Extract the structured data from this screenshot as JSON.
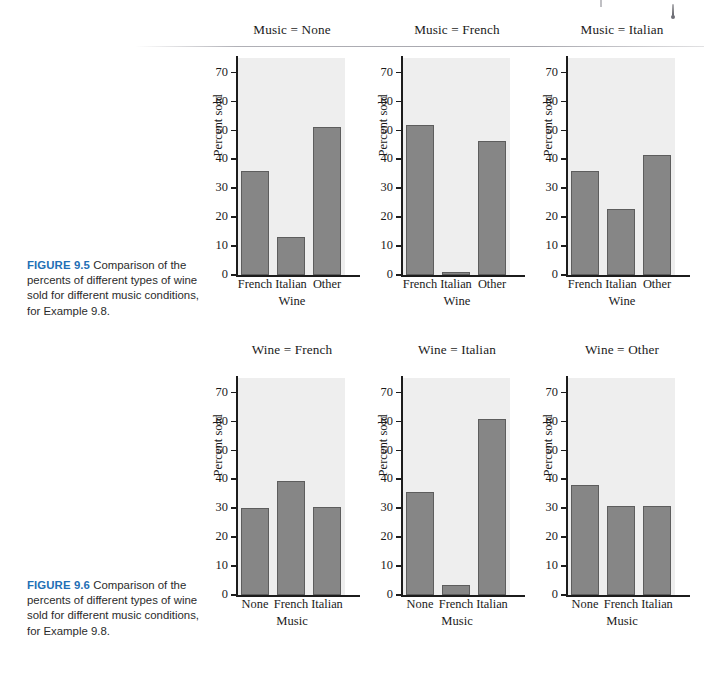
{
  "document": {
    "figures": [
      {
        "id": "figure-9-5",
        "caption_label": "FIGURE 9.5",
        "caption_text": "Comparison of the percents of different types of wine sold for different music conditions, for Example 9.8."
      },
      {
        "id": "figure-9-6",
        "caption_label": "FIGURE 9.6",
        "caption_text": "Comparison of the percents of different types of wine sold for different music conditions, for Example 9.8."
      }
    ]
  },
  "axis": {
    "y_label": "Percent sold",
    "y_ticks": [
      "0",
      "10",
      "20",
      "30",
      "40",
      "50",
      "60",
      "70"
    ],
    "y_tick_values": [
      0,
      10,
      20,
      30,
      40,
      50,
      60,
      70
    ],
    "y_min": 0,
    "y_max": 75
  },
  "colors": {
    "bar_fill": "#868686",
    "bar_stroke": "#5d5d5d",
    "plot_background": "#eeeeee",
    "axis": "#1c1c1c",
    "caption_label": "#1f6fb5",
    "page_background": "#ffffff"
  },
  "chart_data": [
    {
      "type": "bar",
      "title": "Music = None",
      "figure": "FIGURE 9.5",
      "xlabel": "Wine",
      "ylabel": "Percent sold",
      "categories": [
        "French",
        "Italian",
        "Other"
      ],
      "values": [
        36,
        13,
        51
      ],
      "ylim": [
        0,
        75
      ],
      "grid": false,
      "legend": "none"
    },
    {
      "type": "bar",
      "title": "Music = French",
      "figure": "FIGURE 9.5",
      "xlabel": "Wine",
      "ylabel": "Percent sold",
      "categories": [
        "French",
        "Italian",
        "Other"
      ],
      "values": [
        51.8,
        1.2,
        46.2
      ],
      "ylim": [
        0,
        75
      ],
      "grid": false,
      "legend": "none"
    },
    {
      "type": "bar",
      "title": "Music = Italian",
      "figure": "FIGURE 9.5",
      "xlabel": "Wine",
      "ylabel": "Percent sold",
      "categories": [
        "French",
        "Italian",
        "Other"
      ],
      "values": [
        35.8,
        22.8,
        41.5
      ],
      "ylim": [
        0,
        75
      ],
      "grid": false,
      "legend": "none"
    },
    {
      "type": "bar",
      "title": "Wine = French",
      "figure": "FIGURE 9.6",
      "xlabel": "Music",
      "ylabel": "Percent sold",
      "categories": [
        "None",
        "French",
        "Italian"
      ],
      "values": [
        30.2,
        39.4,
        30.4
      ],
      "ylim": [
        0,
        75
      ],
      "grid": false,
      "legend": "none"
    },
    {
      "type": "bar",
      "title": "Wine = Italian",
      "figure": "FIGURE 9.6",
      "xlabel": "Music",
      "ylabel": "Percent sold",
      "categories": [
        "None",
        "French",
        "Italian"
      ],
      "values": [
        35.7,
        3.4,
        60.8
      ],
      "ylim": [
        0,
        75
      ],
      "grid": false,
      "legend": "none"
    },
    {
      "type": "bar",
      "title": "Wine = Other",
      "figure": "FIGURE 9.6",
      "xlabel": "Music",
      "ylabel": "Percent sold",
      "categories": [
        "None",
        "French",
        "Italian"
      ],
      "values": [
        38.1,
        30.9,
        30.8
      ],
      "ylim": [
        0,
        75
      ],
      "grid": false,
      "legend": "none"
    }
  ]
}
